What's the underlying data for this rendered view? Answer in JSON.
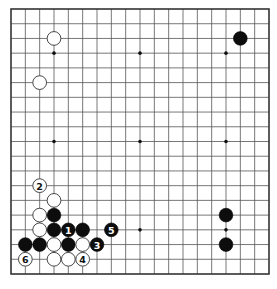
{
  "board": {
    "size": 19,
    "colors": {
      "background": "#ffffff",
      "lines": "#555555",
      "black_stone": "#0d0d0d",
      "white_stone": "#ffffff"
    },
    "star_points": [
      [
        3,
        3
      ],
      [
        9,
        3
      ],
      [
        15,
        3
      ],
      [
        3,
        9
      ],
      [
        9,
        9
      ],
      [
        15,
        9
      ],
      [
        3,
        15
      ],
      [
        9,
        15
      ],
      [
        15,
        15
      ]
    ],
    "stones": [
      {
        "color": "white",
        "col": 3,
        "row": 2,
        "label": ""
      },
      {
        "color": "white",
        "col": 2,
        "row": 5,
        "label": ""
      },
      {
        "color": "black",
        "col": 16,
        "row": 2,
        "label": ""
      },
      {
        "color": "black",
        "col": 15,
        "row": 14,
        "label": ""
      },
      {
        "color": "black",
        "col": 15,
        "row": 16,
        "label": ""
      },
      {
        "color": "white",
        "col": 2,
        "row": 12,
        "label": "2"
      },
      {
        "color": "white",
        "col": 3,
        "row": 13,
        "label": ""
      },
      {
        "color": "white",
        "col": 2,
        "row": 14,
        "label": ""
      },
      {
        "color": "black",
        "col": 3,
        "row": 14,
        "label": ""
      },
      {
        "color": "white",
        "col": 2,
        "row": 15,
        "label": ""
      },
      {
        "color": "black",
        "col": 3,
        "row": 15,
        "label": ""
      },
      {
        "color": "black",
        "col": 4,
        "row": 15,
        "label": "1"
      },
      {
        "color": "black",
        "col": 5,
        "row": 15,
        "label": ""
      },
      {
        "color": "black",
        "col": 7,
        "row": 15,
        "label": "5"
      },
      {
        "color": "black",
        "col": 1,
        "row": 16,
        "label": ""
      },
      {
        "color": "black",
        "col": 2,
        "row": 16,
        "label": ""
      },
      {
        "color": "white",
        "col": 3,
        "row": 16,
        "label": ""
      },
      {
        "color": "black",
        "col": 4,
        "row": 16,
        "label": ""
      },
      {
        "color": "white",
        "col": 5,
        "row": 16,
        "label": ""
      },
      {
        "color": "black",
        "col": 6,
        "row": 16,
        "label": "3"
      },
      {
        "color": "white",
        "col": 1,
        "row": 17,
        "label": "6"
      },
      {
        "color": "white",
        "col": 3,
        "row": 17,
        "label": ""
      },
      {
        "color": "white",
        "col": 4,
        "row": 17,
        "label": ""
      },
      {
        "color": "white",
        "col": 5,
        "row": 17,
        "label": "4"
      }
    ]
  }
}
